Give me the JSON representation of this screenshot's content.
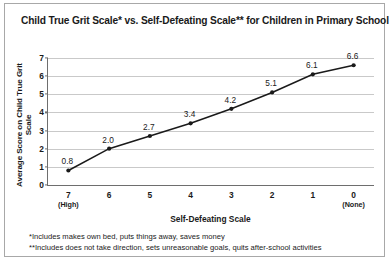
{
  "chart_data": {
    "type": "line",
    "title": "Child True Grit Scale* vs. Self-Defeating Scale** for Children in Primary School",
    "xlabel": "Self-Defeating Scale",
    "ylabel": "Average Score on Child True Grit Scale",
    "categories": [
      "7",
      "6",
      "5",
      "4",
      "3",
      "2",
      "1",
      "0"
    ],
    "category_sublabels": [
      "(High)",
      "",
      "",
      "",
      "",
      "",
      "",
      "(None)"
    ],
    "values": [
      0.8,
      2.0,
      2.7,
      3.4,
      4.2,
      5.1,
      6.1,
      6.6
    ],
    "point_labels": [
      "0.8",
      "2.0",
      "2.7",
      "3.4",
      "4.2",
      "5.1",
      "6.1",
      "6.6"
    ],
    "yticks": [
      0,
      1,
      2,
      3,
      4,
      5,
      6,
      7
    ],
    "ytick_labels": [
      "0",
      "1",
      "2",
      "3",
      "4",
      "5",
      "6",
      "7"
    ],
    "ylim": [
      0,
      7
    ],
    "grid": true,
    "legend": false,
    "line_color": "#1a1a1a",
    "marker_color": "#1a1a1a",
    "grid_color": "#c9c9c9",
    "axis_color": "#6e6e6e"
  },
  "footnotes": [
    "*Includes makes own bed, puts things away, saves money",
    "**Includes does not take direction, sets unreasonable goals, quits after-school activities"
  ]
}
